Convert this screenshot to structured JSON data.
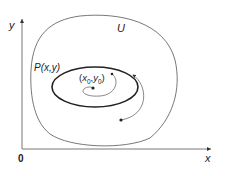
{
  "diagram": {
    "axes": {
      "x_label": "x",
      "y_label": "y",
      "origin_label": "0"
    },
    "region_label": "U",
    "closed_orbit_label": "P(x,y)",
    "equilibrium_label": {
      "open": "(",
      "x": "x",
      "x_sub": "0",
      "comma": ",",
      "y": "y",
      "y_sub": "0",
      "close": ")"
    },
    "colors": {
      "stroke": "#333333",
      "thin_stroke": "#555555",
      "background": "#ffffff"
    }
  }
}
